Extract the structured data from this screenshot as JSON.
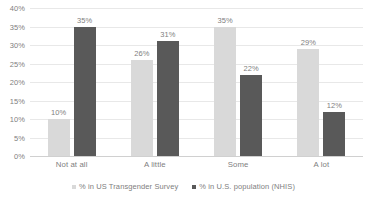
{
  "chart_data": {
    "type": "bar",
    "title": "",
    "subtitle": "",
    "xlabel": "",
    "ylabel": "",
    "categories": [
      "Not at all",
      "A little",
      "Some",
      "A lot"
    ],
    "series": [
      {
        "name": "% in US Transgender Survey",
        "color": "#d9d9d9",
        "values": [
          10,
          26,
          35,
          29
        ],
        "labels": [
          "10%",
          "26%",
          "35%",
          "29%"
        ]
      },
      {
        "name": "% in U.S. population (NHIS)",
        "color": "#595959",
        "values": [
          35,
          31,
          22,
          12
        ],
        "labels": [
          "35%",
          "31%",
          "22%",
          "12%"
        ]
      }
    ],
    "ylim": [
      0,
      40
    ],
    "ytick_values": [
      0,
      5,
      10,
      15,
      20,
      25,
      30,
      35,
      40
    ],
    "ytick_labels": [
      "0%",
      "5%",
      "10%",
      "15%",
      "20%",
      "25%",
      "30%",
      "35%",
      "40%"
    ],
    "grid": true,
    "grid_axis": "y",
    "legend_position": "bottom-center",
    "orientation": "vertical",
    "grouped": true
  },
  "axis": {
    "y_labels": [
      "40%",
      "35%",
      "30%",
      "25%",
      "20%",
      "15%",
      "10%",
      "5%",
      "0%"
    ]
  },
  "legend": {
    "items": [
      {
        "label": "% in US Transgender Survey",
        "color": "#d9d9d9"
      },
      {
        "label": "% in U.S. population (NHIS)",
        "color": "#595959"
      }
    ]
  },
  "colors": {
    "series_light": "#d9d9d9",
    "series_dark": "#595959",
    "gridline": "#e8e8e8",
    "text": "#808080",
    "background": "#ffffff"
  }
}
